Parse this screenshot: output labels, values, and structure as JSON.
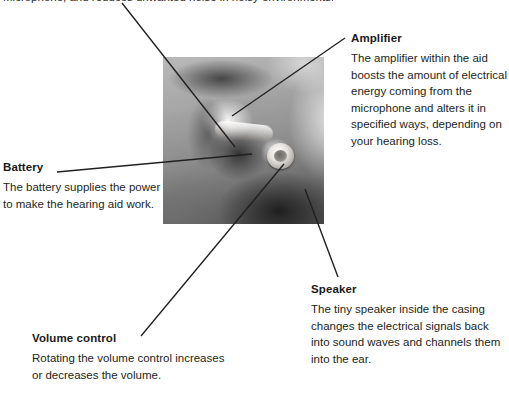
{
  "page": {
    "width": 509,
    "height": 400,
    "background": "#ffffff",
    "text_color": "#231f20",
    "line_color": "#231f20",
    "clipped_top_text": "Microphone, and reduces unwanted noise in noisy environments."
  },
  "figure": {
    "name": "hearing-aid-anatomy-photo",
    "alt": "Grayscale close-up photograph of an ear wearing an in-the-ear hearing aid",
    "x": 163,
    "y": 57,
    "width": 161,
    "height": 167
  },
  "callouts": [
    {
      "id": "microphone",
      "title": "",
      "body": "Microphone, and reduces unwanted noise in noisy environments."
    },
    {
      "id": "amplifier",
      "title": "Amplifier",
      "body": "The amplifier within the aid boosts the amount of electrical energy coming from the microphone and alters it in specified ways, depending on your hearing loss."
    },
    {
      "id": "battery",
      "title": "Battery",
      "body": "The battery supplies the power to make the hearing aid work."
    },
    {
      "id": "speaker",
      "title": "Speaker",
      "body": "The tiny speaker inside the casing changes the electrical signals back into sound waves and channels them into the ear."
    },
    {
      "id": "volume_control",
      "title": "Volume control",
      "body": "Rotating the volume control increases or decreases the volume."
    }
  ],
  "leader_lines": [
    {
      "name": "leader-microphone",
      "x1": 122,
      "y1": 3,
      "x2": 235,
      "y2": 147
    },
    {
      "name": "leader-amplifier",
      "x1": 345,
      "y1": 38,
      "x2": 232,
      "y2": 116
    },
    {
      "name": "leader-battery",
      "x1": 57,
      "y1": 172,
      "x2": 252,
      "y2": 154
    },
    {
      "name": "leader-speaker",
      "x1": 305,
      "y1": 189,
      "x2": 338,
      "y2": 277
    },
    {
      "name": "leader-volume-control",
      "x1": 141,
      "y1": 336,
      "x2": 284,
      "y2": 164
    }
  ]
}
